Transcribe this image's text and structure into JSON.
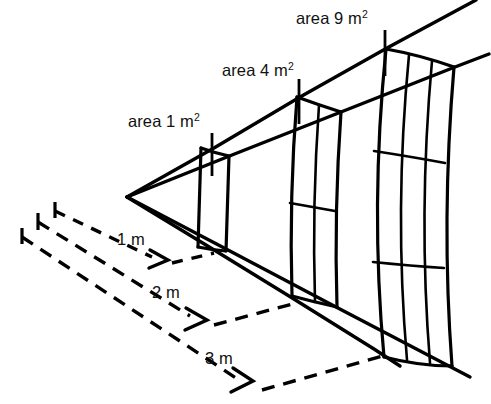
{
  "figure": {
    "type": "diagram",
    "background_color": "#ffffff",
    "line_color": "#000000",
    "apex": {
      "label": "point-source-apex",
      "x": 127,
      "y": 197
    }
  },
  "area_labels": [
    {
      "id": "area-1",
      "text": "area 1 m",
      "superscript": "2",
      "full_text": "area 1 m2",
      "distance_m": 1,
      "area_m2": 1,
      "text_x": 128,
      "text_y": 127,
      "leader_x": 212,
      "leader_y1": 133,
      "leader_y2": 176
    },
    {
      "id": "area-4",
      "text": "area 4 m",
      "superscript": "2",
      "full_text": "area 4 m2",
      "distance_m": 2,
      "area_m2": 4,
      "text_x": 222,
      "text_y": 76,
      "leader_x": 299,
      "leader_y1": 79,
      "leader_y2": 124
    },
    {
      "id": "area-9",
      "text": "area 9 m",
      "superscript": "2",
      "full_text": "area 9 m2",
      "distance_m": 3,
      "area_m2": 9,
      "text_x": 296,
      "text_y": 24,
      "leader_x": 385,
      "leader_y1": 30,
      "leader_y2": 76
    }
  ],
  "distance_labels": [
    {
      "id": "dist-1",
      "text": "1 m",
      "value_m": 1,
      "text_x": 117,
      "text_y": 245
    },
    {
      "id": "dist-2",
      "text": "2 m",
      "value_m": 2,
      "text_x": 152,
      "text_y": 298
    },
    {
      "id": "dist-3",
      "text": "3 m",
      "value_m": 3,
      "text_x": 205,
      "text_y": 364
    }
  ],
  "panels": [
    {
      "id": "panel-1m2",
      "grid": "1x1",
      "cells": 1,
      "distance_m": 1,
      "area_m2": 1
    },
    {
      "id": "panel-4m2",
      "grid": "2x2",
      "cells": 4,
      "distance_m": 2,
      "area_m2": 4
    },
    {
      "id": "panel-9m2",
      "grid": "3x3",
      "cells": 9,
      "distance_m": 3,
      "area_m2": 9
    }
  ],
  "rays": {
    "count": 4,
    "description": "four solid rays from the point source through the panel corners"
  },
  "baseline": {
    "description": "three dashed ground lines with arrowheads marking 1 m, 2 m and 3 m distances",
    "count": 3
  }
}
